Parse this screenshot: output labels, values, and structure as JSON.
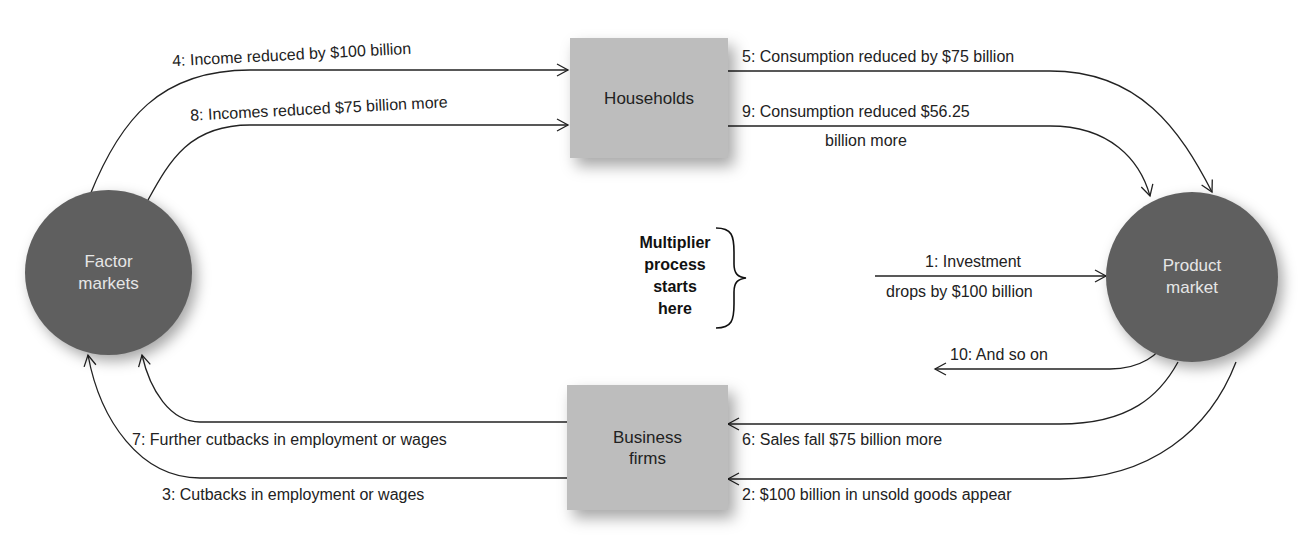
{
  "nodes": {
    "households": "Households",
    "business_firms": [
      "Business",
      "firms"
    ],
    "factor_markets": [
      "Factor",
      "markets"
    ],
    "product_market": [
      "Product",
      "market"
    ]
  },
  "start_note": [
    "Multiplier",
    "process",
    "starts",
    "here"
  ],
  "flows": [
    {
      "step": 1,
      "text_line1": "1: Investment",
      "text_line2": "drops by $100 billion"
    },
    {
      "step": 2,
      "text": "2: $100 billion in unsold goods appear"
    },
    {
      "step": 3,
      "text": "3: Cutbacks in employment or wages"
    },
    {
      "step": 4,
      "text": "4: Income reduced by $100 billion"
    },
    {
      "step": 5,
      "text": "5: Consumption reduced by $75 billion"
    },
    {
      "step": 6,
      "text": "6: Sales fall $75 billion more"
    },
    {
      "step": 7,
      "text": "7: Further cutbacks in employment or wages"
    },
    {
      "step": 8,
      "text": "8: Incomes reduced $75 billion more"
    },
    {
      "step": 9,
      "text_line1": "9: Consumption reduced $56.25",
      "text_line2": "billion more"
    },
    {
      "step": 10,
      "text": "10: And so on"
    }
  ],
  "colors": {
    "box": "#bdbdbd",
    "circle": "#5f5f5f",
    "line": "#222222"
  }
}
